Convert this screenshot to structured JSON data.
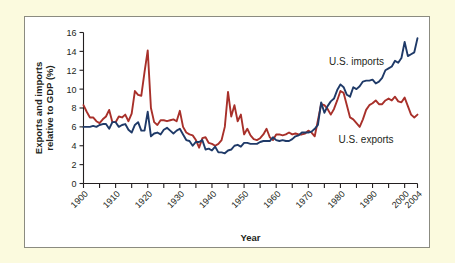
{
  "figure": {
    "background_color": "#fbfade",
    "plot_background_color": "#ffffff",
    "border_color": "#8b8b80"
  },
  "chart_data": {
    "type": "line",
    "title": "",
    "subtitle": "",
    "xlabel": "Year",
    "ylabel": "Exports and imports relative to GDP (%)",
    "xlim": [
      1900,
      2004
    ],
    "ylim": [
      0,
      16
    ],
    "grid": false,
    "legend_position": "inline-annotation",
    "y_ticks": [
      0,
      2,
      4,
      6,
      8,
      10,
      12,
      14,
      16
    ],
    "y_tick_labels": [
      "0",
      "2",
      "4",
      "6",
      "8",
      "10",
      "12",
      "14",
      "16"
    ],
    "x_ticks": [
      1900,
      1905,
      1910,
      1915,
      1920,
      1925,
      1930,
      1935,
      1940,
      1945,
      1950,
      1955,
      1960,
      1965,
      1970,
      1975,
      1980,
      1985,
      1990,
      1995,
      2000,
      2004
    ],
    "x_tick_labels_major": [
      "1900",
      "1910",
      "1920",
      "1930",
      "1940",
      "1950",
      "1960",
      "1970",
      "1980",
      "1990",
      "2000",
      "2004"
    ],
    "x_tick_label_years": [
      1900,
      1910,
      1920,
      1930,
      1940,
      1950,
      1960,
      1970,
      1980,
      1990,
      2000,
      2004
    ],
    "annotations": [
      {
        "text": "U.S. imports",
        "x": 1985,
        "y": 12.6
      },
      {
        "text": "U.S. exports",
        "x": 1988,
        "y": 4.3
      }
    ],
    "x": [
      1900,
      1901,
      1902,
      1903,
      1904,
      1905,
      1906,
      1907,
      1908,
      1909,
      1910,
      1911,
      1912,
      1913,
      1914,
      1915,
      1916,
      1917,
      1918,
      1919,
      1920,
      1921,
      1922,
      1923,
      1924,
      1925,
      1926,
      1927,
      1928,
      1929,
      1930,
      1931,
      1932,
      1933,
      1934,
      1935,
      1936,
      1937,
      1938,
      1939,
      1940,
      1941,
      1942,
      1943,
      1944,
      1945,
      1946,
      1947,
      1948,
      1949,
      1950,
      1951,
      1952,
      1953,
      1954,
      1955,
      1956,
      1957,
      1958,
      1959,
      1960,
      1961,
      1962,
      1963,
      1964,
      1965,
      1966,
      1967,
      1968,
      1969,
      1970,
      1971,
      1972,
      1973,
      1974,
      1975,
      1976,
      1977,
      1978,
      1979,
      1980,
      1981,
      1982,
      1983,
      1984,
      1985,
      1986,
      1987,
      1988,
      1989,
      1990,
      1991,
      1992,
      1993,
      1994,
      1995,
      1996,
      1997,
      1998,
      1999,
      2000,
      2001,
      2002,
      2003,
      2004
    ],
    "series": [
      {
        "name": "U.S. exports",
        "color": "#a8302a",
        "values": [
          8.3,
          7.6,
          7.0,
          7.0,
          6.6,
          6.4,
          6.8,
          7.1,
          7.8,
          6.5,
          6.5,
          7.1,
          7.0,
          7.3,
          6.6,
          7.4,
          9.8,
          9.4,
          9.3,
          11.8,
          14.1,
          8.0,
          6.5,
          6.2,
          6.7,
          6.7,
          6.6,
          6.7,
          6.8,
          6.6,
          7.7,
          6.0,
          5.4,
          5.2,
          5.1,
          4.6,
          3.8,
          4.8,
          4.9,
          4.3,
          4.2,
          4.0,
          4.2,
          4.6,
          6.0,
          9.7,
          7.1,
          8.3,
          6.6,
          7.3,
          5.2,
          5.8,
          5.1,
          4.7,
          4.6,
          4.8,
          5.2,
          5.8,
          4.9,
          4.6,
          5.2,
          5.2,
          5.1,
          5.2,
          5.4,
          5.2,
          5.3,
          5.2,
          5.2,
          5.3,
          5.6,
          5.4,
          5.0,
          6.7,
          8.4,
          8.3,
          7.9,
          7.3,
          7.9,
          8.8,
          9.8,
          9.6,
          8.3,
          7.0,
          6.8,
          6.4,
          6.0,
          6.8,
          7.8,
          8.3,
          8.5,
          8.8,
          8.4,
          8.4,
          8.8,
          9.0,
          8.8,
          9.2,
          8.7,
          8.6,
          9.1,
          8.2,
          7.3,
          7.0,
          7.3
        ]
      },
      {
        "name": "U.S. imports",
        "color": "#1f3a68",
        "values": [
          6.0,
          6.0,
          6.0,
          6.1,
          6.0,
          6.2,
          6.3,
          6.3,
          5.8,
          6.5,
          6.5,
          6.0,
          6.2,
          6.3,
          5.7,
          5.4,
          6.2,
          6.5,
          5.6,
          5.6,
          7.6,
          5.0,
          5.3,
          5.4,
          5.2,
          5.7,
          5.9,
          5.6,
          5.3,
          5.6,
          5.8,
          5.2,
          4.6,
          4.5,
          4.0,
          4.4,
          4.4,
          4.6,
          3.6,
          3.7,
          3.5,
          3.9,
          3.3,
          3.3,
          3.2,
          3.5,
          3.6,
          4.0,
          4.1,
          3.9,
          4.3,
          4.3,
          4.2,
          4.2,
          4.2,
          4.4,
          4.5,
          4.5,
          4.5,
          4.9,
          4.6,
          4.5,
          4.6,
          4.5,
          4.5,
          4.7,
          5.0,
          5.1,
          5.4,
          5.4,
          5.4,
          5.5,
          5.8,
          6.2,
          8.6,
          7.5,
          8.2,
          8.7,
          9.0,
          9.9,
          10.5,
          10.2,
          9.4,
          9.2,
          10.2,
          10.0,
          10.3,
          10.8,
          10.9,
          10.9,
          11.0,
          10.6,
          10.8,
          11.2,
          12.0,
          12.2,
          12.4,
          13.0,
          12.8,
          13.3,
          15.0,
          13.5,
          13.7,
          13.9,
          15.4
        ]
      }
    ]
  }
}
